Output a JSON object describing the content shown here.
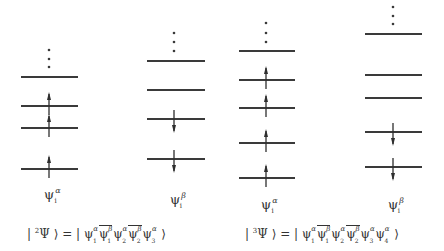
{
  "diagram": {
    "columns": [
      {
        "id": "col1",
        "spin": "alpha",
        "line_x1": 21,
        "line_x2": 78,
        "arrow_x": 49,
        "dots_y": [
          50,
          59,
          67
        ],
        "levels": [
          {
            "y": 77,
            "occupancy": "empty"
          },
          {
            "y": 106,
            "occupancy": "up"
          },
          {
            "y": 128,
            "occupancy": "up"
          },
          {
            "y": 169,
            "occupancy": "up"
          }
        ],
        "label": {
          "base": "ψ",
          "sup": "α",
          "sub": "i",
          "x": 44,
          "y": 188
        }
      },
      {
        "id": "col2",
        "spin": "beta",
        "line_x1": 147,
        "line_x2": 205,
        "arrow_x": 174,
        "dots_y": [
          33,
          42,
          51
        ],
        "levels": [
          {
            "y": 61,
            "occupancy": "empty"
          },
          {
            "y": 90,
            "occupancy": "empty"
          },
          {
            "y": 119,
            "occupancy": "down"
          },
          {
            "y": 159,
            "occupancy": "down"
          }
        ],
        "label": {
          "base": "ψ",
          "sup": "β",
          "sub": "i",
          "x": 170,
          "y": 193
        }
      },
      {
        "id": "col3",
        "spin": "alpha",
        "line_x1": 239,
        "line_x2": 295,
        "arrow_x": 266,
        "dots_y": [
          23,
          33,
          42
        ],
        "levels": [
          {
            "y": 51,
            "occupancy": "empty"
          },
          {
            "y": 80,
            "occupancy": "up"
          },
          {
            "y": 108,
            "occupancy": "up"
          },
          {
            "y": 143,
            "occupancy": "up"
          },
          {
            "y": 178,
            "occupancy": "up"
          }
        ],
        "label": {
          "base": "ψ",
          "sup": "α",
          "sub": "i",
          "x": 261,
          "y": 198
        }
      },
      {
        "id": "col4",
        "spin": "beta",
        "line_x1": 365,
        "line_x2": 422,
        "arrow_x": 393,
        "dots_y": [
          7,
          16,
          24
        ],
        "levels": [
          {
            "y": 34,
            "occupancy": "empty"
          },
          {
            "y": 75,
            "occupancy": "empty"
          },
          {
            "y": 98,
            "occupancy": "empty"
          },
          {
            "y": 132,
            "occupancy": "down"
          },
          {
            "y": 167,
            "occupancy": "down"
          }
        ],
        "label": {
          "base": "ψ",
          "sup": "β",
          "sub": "i",
          "x": 388,
          "y": 198
        }
      }
    ],
    "equations": [
      {
        "id": "doublet",
        "x": 27,
        "prefix": "|",
        "multiplicity": "2",
        "psi": "Ψ",
        "ket_close": "⟩ = |",
        "terms": [
          {
            "base": "ψ",
            "sup": "α",
            "sub": "1",
            "bar": false
          },
          {
            "base": "ψ",
            "sup": "β",
            "sub": "1",
            "bar": true
          },
          {
            "base": "ψ",
            "sup": "α",
            "sub": "2",
            "bar": false
          },
          {
            "base": "ψ",
            "sup": "β",
            "sub": "2",
            "bar": true
          },
          {
            "base": "ψ",
            "sup": "α",
            "sub": "3",
            "bar": false
          }
        ],
        "end": "⟩"
      },
      {
        "id": "triplet",
        "x": 245,
        "prefix": "|",
        "multiplicity": "3",
        "psi": "Ψ",
        "ket_close": "⟩ = |",
        "terms": [
          {
            "base": "ψ",
            "sup": "α",
            "sub": "1",
            "bar": false
          },
          {
            "base": "ψ",
            "sup": "β",
            "sub": "1",
            "bar": true
          },
          {
            "base": "ψ",
            "sup": "α",
            "sub": "2",
            "bar": false
          },
          {
            "base": "ψ",
            "sup": "β",
            "sub": "2",
            "bar": true
          },
          {
            "base": "ψ",
            "sup": "α",
            "sub": "3",
            "bar": false
          },
          {
            "base": "ψ",
            "sup": "α",
            "sub": "4",
            "bar": false
          }
        ],
        "end": "⟩"
      }
    ]
  }
}
